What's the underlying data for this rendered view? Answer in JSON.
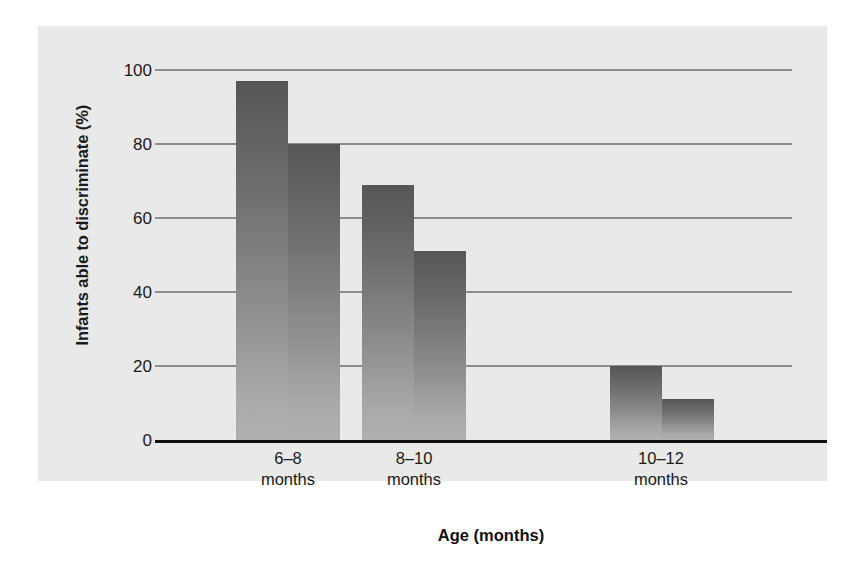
{
  "chart_data": {
    "type": "bar",
    "title": "",
    "subtitle": "",
    "xlabel": "Age (months)",
    "ylabel": "Infants able to discriminate (%)",
    "categories": [
      "6–8\nmonths",
      "8–10\nmonths",
      "10–12\nmonths"
    ],
    "category_labels": [
      {
        "line1": "6–8",
        "line2": "months"
      },
      {
        "line1": "8–10",
        "line2": "months"
      },
      {
        "line1": "10–12",
        "line2": "months"
      }
    ],
    "series": [
      {
        "name": "bar-1",
        "values": [
          97,
          69,
          20
        ]
      },
      {
        "name": "bar-2",
        "values": [
          80,
          51,
          11
        ]
      }
    ],
    "bars": [
      {
        "group": 0,
        "index": 0,
        "value": 97
      },
      {
        "group": 0,
        "index": 1,
        "value": 80
      },
      {
        "group": 1,
        "index": 0,
        "value": 69
      },
      {
        "group": 1,
        "index": 1,
        "value": 51
      },
      {
        "group": 2,
        "index": 0,
        "value": 20
      },
      {
        "group": 2,
        "index": 1,
        "value": 11
      }
    ],
    "ylim": [
      0,
      100
    ],
    "yticks": [
      100,
      80,
      60,
      40,
      20,
      0
    ],
    "ytick_labels": [
      "100",
      "80",
      "60",
      "40",
      "20",
      "0"
    ],
    "grid": true,
    "grid_axis": "y",
    "legend": false,
    "legend_position": "none",
    "annotations": []
  },
  "colors": {
    "panel_background": "#e9e9e9",
    "page_background": "#ffffff",
    "gridline": "#8d8d8d",
    "axis_line": "#111111",
    "bar_gradient_top": "#565656",
    "bar_gradient_bottom": "#b0b0b0",
    "text": "#1a1a1a"
  }
}
